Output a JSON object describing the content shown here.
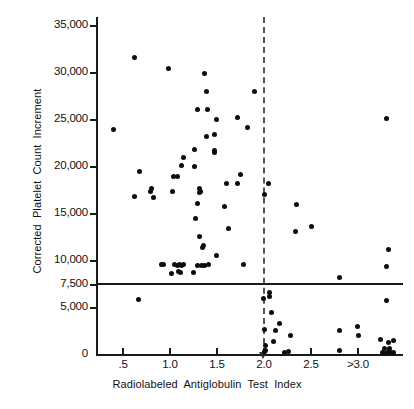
{
  "chart_data": {
    "type": "scatter",
    "title": "",
    "xlabel": "Radiolabeled  Antiglobulin  Test  Index",
    "ylabel": "Corrected  Platelet  Count  Increment",
    "xlim": [
      0.18,
      3.45
    ],
    "ylim": [
      0,
      35000
    ],
    "grid": false,
    "legend": null,
    "x_ticks": [
      {
        "value": 0.5,
        "label": ".5"
      },
      {
        "value": 1.0,
        "label": "1.0"
      },
      {
        "value": 1.5,
        "label": "1.5"
      },
      {
        "value": 2.0,
        "label": "2.0"
      },
      {
        "value": 2.5,
        "label": "2.5"
      },
      {
        "value": 3.0,
        "label": ">3.0"
      }
    ],
    "y_ticks": [
      {
        "value": 35000,
        "label": "35,000"
      },
      {
        "value": 30000,
        "label": "30,000"
      },
      {
        "value": 25000,
        "label": "25,000"
      },
      {
        "value": 20000,
        "label": "20,000"
      },
      {
        "value": 15000,
        "label": "15,000"
      },
      {
        "value": 10000,
        "label": "10,000"
      },
      {
        "value": 7500,
        "label": "7,500"
      },
      {
        "value": 5000,
        "label": "5,000"
      },
      {
        "value": 0,
        "label": "0"
      }
    ],
    "annotations": [
      {
        "name": "threshold-line",
        "type": "hline",
        "value": 7500,
        "style": "solid"
      },
      {
        "name": "cutoff-line",
        "type": "vline",
        "value": 2.0,
        "style": "dashed",
        "marker": "arrow-down"
      }
    ],
    "marker": {
      "shape": "circle",
      "color": "#0d0d0d",
      "size": 5
    },
    "points": [
      [
        0.62,
        31700
      ],
      [
        0.98,
        30500
      ],
      [
        1.37,
        30000
      ],
      [
        1.39,
        28000
      ],
      [
        1.9,
        28000
      ],
      [
        1.29,
        26100
      ],
      [
        1.4,
        26100
      ],
      [
        1.49,
        25100
      ],
      [
        1.72,
        25300
      ],
      [
        3.3,
        25200
      ],
      [
        0.4,
        24000
      ],
      [
        1.39,
        23200
      ],
      [
        1.47,
        23500
      ],
      [
        1.82,
        24200
      ],
      [
        1.26,
        21900
      ],
      [
        1.14,
        21000
      ],
      [
        1.47,
        21800
      ],
      [
        1.47,
        21500
      ],
      [
        1.12,
        20200
      ],
      [
        1.26,
        20100
      ],
      [
        0.68,
        19500
      ],
      [
        1.75,
        19200
      ],
      [
        1.04,
        19000
      ],
      [
        1.08,
        19000
      ],
      [
        1.6,
        18200
      ],
      [
        1.72,
        18200
      ],
      [
        2.05,
        18200
      ],
      [
        0.8,
        17700
      ],
      [
        0.79,
        17400
      ],
      [
        1.03,
        17400
      ],
      [
        1.31,
        17700
      ],
      [
        1.32,
        17400
      ],
      [
        1.31,
        17300
      ],
      [
        2.01,
        17100
      ],
      [
        0.62,
        16900
      ],
      [
        0.82,
        16800
      ],
      [
        1.29,
        16100
      ],
      [
        1.58,
        15800
      ],
      [
        2.35,
        16000
      ],
      [
        1.27,
        14500
      ],
      [
        2.5,
        13700
      ],
      [
        1.62,
        13500
      ],
      [
        2.33,
        13100
      ],
      [
        1.31,
        12600
      ],
      [
        1.36,
        11700
      ],
      [
        1.35,
        11400
      ],
      [
        3.32,
        11200
      ],
      [
        1.49,
        10600
      ],
      [
        0.91,
        9600
      ],
      [
        0.93,
        9600
      ],
      [
        1.05,
        9600
      ],
      [
        1.08,
        9500
      ],
      [
        1.1,
        9600
      ],
      [
        1.12,
        9500
      ],
      [
        1.14,
        9600
      ],
      [
        1.29,
        9500
      ],
      [
        1.33,
        9500
      ],
      [
        1.37,
        9500
      ],
      [
        1.41,
        9600
      ],
      [
        1.78,
        9600
      ],
      [
        3.3,
        9400
      ],
      [
        1.02,
        8700
      ],
      [
        1.09,
        8900
      ],
      [
        1.11,
        8800
      ],
      [
        1.25,
        8800
      ],
      [
        2.8,
        8200
      ],
      [
        0.66,
        5900
      ],
      [
        1.99,
        6000
      ],
      [
        2.06,
        6700
      ],
      [
        2.06,
        6200
      ],
      [
        3.3,
        5800
      ],
      [
        2.08,
        4500
      ],
      [
        2.0,
        2700
      ],
      [
        2.12,
        2600
      ],
      [
        2.17,
        3300
      ],
      [
        2.8,
        2600
      ],
      [
        2.99,
        3000
      ],
      [
        3.0,
        2100
      ],
      [
        2.28,
        2100
      ],
      [
        2.02,
        1000
      ],
      [
        2.1,
        1400
      ],
      [
        3.24,
        1600
      ],
      [
        3.32,
        1300
      ],
      [
        3.38,
        1500
      ],
      [
        2.0,
        400
      ],
      [
        2.02,
        500
      ],
      [
        2.22,
        300
      ],
      [
        2.26,
        350
      ],
      [
        2.8,
        500
      ],
      [
        3.26,
        300
      ],
      [
        3.29,
        200
      ],
      [
        3.32,
        350
      ],
      [
        3.35,
        250
      ],
      [
        3.38,
        300
      ],
      [
        3.28,
        700
      ],
      [
        3.34,
        650
      ]
    ]
  },
  "figure": {
    "background": "#ffffff",
    "axis_color": "#1a1a1a"
  }
}
